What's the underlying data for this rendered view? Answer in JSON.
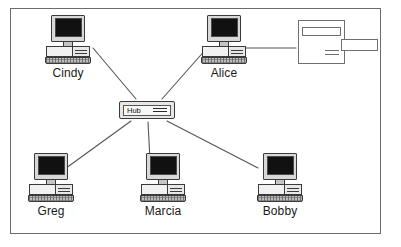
{
  "diagram": {
    "frame": {
      "visible": true,
      "border_color": "#6b6b6b"
    },
    "background_color": "#ffffff",
    "line_color": "#555555"
  },
  "hub": {
    "label": "Hub",
    "icon": "network-hub-icon",
    "x": 119,
    "y": 101
  },
  "printer": {
    "icon": "printer-icon",
    "label": "",
    "x": 298,
    "y": 20
  },
  "nodes": [
    {
      "label": "Cindy",
      "icon": "desktop-computer-icon",
      "x": 33,
      "y": 15
    },
    {
      "label": "Alice",
      "icon": "desktop-computer-icon",
      "x": 189,
      "y": 15
    },
    {
      "label": "Greg",
      "icon": "desktop-computer-icon",
      "x": 16,
      "y": 153
    },
    {
      "label": "Marcia",
      "icon": "desktop-computer-icon",
      "x": 128,
      "y": 153
    },
    {
      "label": "Bobby",
      "icon": "desktop-computer-icon",
      "x": 245,
      "y": 153
    }
  ],
  "connections": [
    {
      "from": "Cindy",
      "to": "Hub",
      "x1": 93,
      "y1": 48,
      "x2": 136,
      "y2": 99
    },
    {
      "from": "Alice",
      "to": "Hub",
      "x1": 207,
      "y1": 48,
      "x2": 162,
      "y2": 99
    },
    {
      "from": "Hub",
      "to": "Greg",
      "x1": 131,
      "y1": 121,
      "x2": 62,
      "y2": 171
    },
    {
      "from": "Hub",
      "to": "Marcia",
      "x1": 148,
      "y1": 122,
      "x2": 150,
      "y2": 160
    },
    {
      "from": "Hub",
      "to": "Bobby",
      "x1": 167,
      "y1": 121,
      "x2": 258,
      "y2": 168
    },
    {
      "from": "Alice",
      "to": "Printer",
      "x1": 243,
      "y1": 48,
      "x2": 296,
      "y2": 48
    }
  ]
}
